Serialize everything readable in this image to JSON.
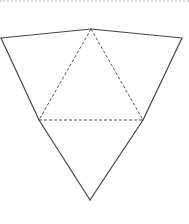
{
  "diagram": {
    "type": "pyramid-net",
    "colors": {
      "solid_edge": "#444444",
      "fold_line": "#555555",
      "top_rule": "#d8d8d8",
      "background": "#ffffff"
    },
    "vertices": {
      "apex_top": [
        91,
        29
      ],
      "outer_left": [
        1,
        38
      ],
      "outer_right": [
        182,
        38
      ],
      "inner_left": [
        39,
        120
      ],
      "inner_right": [
        143,
        120
      ],
      "bottom_tip": [
        90,
        200
      ]
    },
    "solid_edges": [
      [
        "outer_left",
        "apex_top"
      ],
      [
        "apex_top",
        "outer_right"
      ],
      [
        "outer_left",
        "inner_left"
      ],
      [
        "outer_right",
        "inner_right"
      ],
      [
        "inner_left",
        "bottom_tip"
      ],
      [
        "inner_right",
        "bottom_tip"
      ]
    ],
    "dashed_edges": [
      [
        "apex_top",
        "inner_left"
      ],
      [
        "apex_top",
        "inner_right"
      ],
      [
        "inner_left",
        "inner_right"
      ]
    ]
  }
}
